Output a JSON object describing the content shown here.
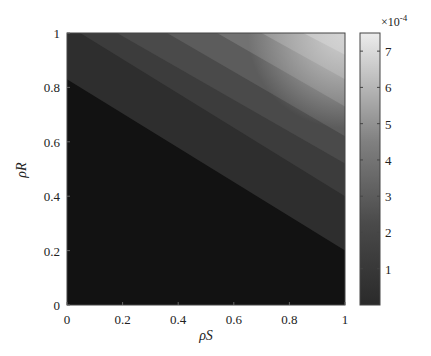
{
  "chart_data": {
    "type": "heatmap",
    "subtype": "filled-contour",
    "title": "",
    "xlabel": "ρS",
    "ylabel": "ρR",
    "xlim": [
      0,
      1
    ],
    "ylim": [
      0,
      1
    ],
    "x_ticks": [
      "0",
      "0.2",
      "0.4",
      "0.6",
      "0.8",
      "1"
    ],
    "y_ticks": [
      "0",
      "0.2",
      "0.4",
      "0.6",
      "0.8",
      "1"
    ],
    "grid": false,
    "colormap": "gray",
    "colorbar": {
      "position": "right",
      "multiplier": "×10-4",
      "multiplier_base": "×10",
      "multiplier_exp": "-4",
      "ticks": [
        "1",
        "2",
        "3",
        "4",
        "5",
        "6",
        "7"
      ],
      "range": [
        0,
        7.5
      ]
    },
    "contour_boundaries": [
      {
        "level": 0.5,
        "from": [
          0,
          0.83
        ],
        "to": [
          1,
          0.2
        ]
      },
      {
        "level": 1.5,
        "from": [
          0,
          1.03
        ],
        "to": [
          1,
          0.4
        ]
      },
      {
        "level": 2.5,
        "from": [
          0.18,
          1.0
        ],
        "to": [
          1,
          0.52
        ]
      },
      {
        "level": 3.5,
        "from": [
          0.36,
          1.0
        ],
        "to": [
          1,
          0.62
        ]
      },
      {
        "level": 4.5,
        "from": [
          0.54,
          1.0
        ],
        "to": [
          1,
          0.73
        ]
      },
      {
        "level": 5.5,
        "from": [
          0.7,
          1.0
        ],
        "to": [
          1,
          0.83
        ]
      },
      {
        "level": 6.5,
        "from": [
          0.85,
          1.0
        ],
        "to": [
          1,
          0.92
        ]
      }
    ],
    "band_colors": [
      "#121212",
      "#2e2e2e",
      "#3c3c3c",
      "#4a4a4a",
      "#5c5c5c",
      "#727272",
      "#8c8c8c",
      "#b4b4b4"
    ]
  }
}
